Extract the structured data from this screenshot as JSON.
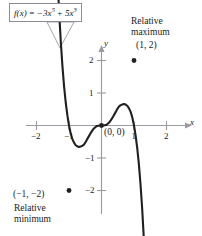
{
  "figure": {
    "background_color": "#ffffff",
    "curve_color": "#231f20",
    "axis_color": "#9a9aa2",
    "text_color": "#1a1a1a",
    "box_border_color": "#8c8c99"
  },
  "formula": {
    "fx": "f(x)",
    "equals": " = ",
    "term1_coef": "−3x",
    "term1_exp": "5",
    "plus": " + ",
    "term2_coef": "5x",
    "term2_exp": "3",
    "full_text": "f(x) = −3x⁵ + 5x³"
  },
  "annotations": {
    "relative_maximum_line1": "Relative",
    "relative_maximum_line2": "maximum",
    "relative_maximum_point": "(1, 2)",
    "relative_minimum_line1": "Relative",
    "relative_minimum_line2": "minimum",
    "relative_minimum_point": "(−1, −2)",
    "origin_point": "(0, 0)"
  },
  "axes": {
    "x_name": "x",
    "y_name": "y",
    "x_ticks": [
      "−2",
      "−1",
      "1",
      "2"
    ],
    "y_ticks": [
      "2",
      "1",
      "−1",
      "−2"
    ]
  },
  "chart_data": {
    "type": "line",
    "title": "",
    "function": "f(x) = -3x^5 + 5x^3",
    "xlabel": "x",
    "ylabel": "y",
    "xlim": [
      -2.5,
      2.5
    ],
    "ylim": [
      -2.8,
      2.6
    ],
    "grid": false,
    "legend": null,
    "x_ticks": [
      -2,
      -1,
      1,
      2
    ],
    "y_ticks": [
      2,
      1,
      -1,
      -2
    ],
    "annotated_points": [
      {
        "label": "(1, 2)",
        "x": 1,
        "y": 2,
        "kind": "relative maximum",
        "marker": "filled-dot"
      },
      {
        "label": "(−1, −2)",
        "x": -1,
        "y": -2,
        "kind": "relative minimum",
        "marker": "filled-dot"
      },
      {
        "label": "(0, 0)",
        "x": 0,
        "y": 0,
        "kind": "inflection / saddle",
        "marker": "filled-dot"
      }
    ],
    "series": [
      {
        "name": "f(x) = -3x^5 + 5x^3",
        "x": [
          -1.35,
          -1.3,
          -1.25,
          -1.2,
          -1.15,
          -1.1,
          -1.05,
          -1.0,
          -0.95,
          -0.9,
          -0.85,
          -0.8,
          -0.75,
          -0.7,
          -0.65,
          -0.6,
          -0.55,
          -0.5,
          -0.45,
          -0.4,
          -0.35,
          -0.3,
          -0.25,
          -0.2,
          -0.15,
          -0.1,
          -0.05,
          0.0,
          0.05,
          0.1,
          0.15,
          0.2,
          0.25,
          0.3,
          0.35,
          0.4,
          0.45,
          0.5,
          0.55,
          0.6,
          0.65,
          0.7,
          0.75,
          0.8,
          0.85,
          0.9,
          0.95,
          1.0,
          1.05,
          1.1,
          1.15,
          1.2,
          1.25,
          1.3,
          1.35
        ],
        "y": [
          4.47,
          3.43,
          2.54,
          1.8,
          1.19,
          0.7,
          0.31,
          0.0,
          -0.24,
          -0.41,
          -0.52,
          -0.6,
          -0.64,
          -0.66,
          -0.65,
          -0.63,
          -0.6,
          -0.53,
          -0.44,
          -0.35,
          -0.26,
          -0.18,
          -0.11,
          -0.06,
          -0.02,
          -0.01,
          0.0,
          0.0,
          0.0,
          0.01,
          0.02,
          0.06,
          0.11,
          0.18,
          0.26,
          0.35,
          0.44,
          0.53,
          0.6,
          0.63,
          0.65,
          0.66,
          0.64,
          0.6,
          0.52,
          0.41,
          0.24,
          0.0,
          -0.31,
          -0.7,
          -1.19,
          -1.8,
          -2.54,
          -3.43,
          -4.47
        ]
      }
    ]
  }
}
